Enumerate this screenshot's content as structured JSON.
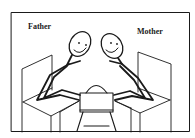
{
  "figure": {
    "labels": {
      "father": "Father",
      "mother": "Mother"
    },
    "colors": {
      "line": "#1a1a1a",
      "background": "#ffffff"
    },
    "figures": [
      "father-stick-figure",
      "mother-stick-figure",
      "child-figure"
    ]
  }
}
